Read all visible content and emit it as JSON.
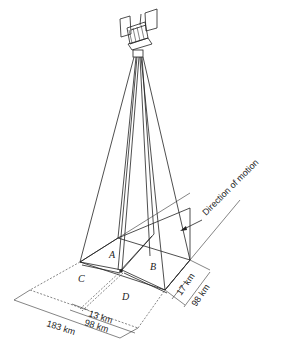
{
  "diagram": {
    "type": "satellite stereo imaging geometry",
    "labels": {
      "direction": "Direction of motion",
      "area_a": "A",
      "area_b": "B",
      "area_c": "C",
      "area_d": "D",
      "dim_17": "17 km",
      "dim_98_right": "98 km",
      "dim_13": "13 km",
      "dim_98_bottom": "98 km",
      "dim_183": "183 km"
    },
    "colors": {
      "line": "#222222",
      "background": "#ffffff"
    }
  }
}
